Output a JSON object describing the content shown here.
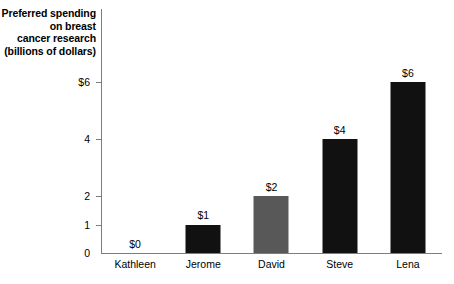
{
  "chart_data": {
    "type": "bar",
    "title": "",
    "ylabel_lines": [
      "Preferred spending",
      "on breast",
      "cancer research",
      "(billions of dollars)"
    ],
    "ylabel": "Preferred spending on breast cancer research (billions of dollars)",
    "xlabel": "",
    "categories": [
      "Kathleen",
      "Jerome",
      "David",
      "Steve",
      "Lena"
    ],
    "values": [
      0,
      1,
      2,
      4,
      6
    ],
    "value_labels": [
      "$0",
      "$1",
      "$2",
      "$4",
      "$6"
    ],
    "bar_colors": [
      "#111111",
      "#111111",
      "#585858",
      "#111111",
      "#111111"
    ],
    "ylim": [
      0,
      6.6
    ],
    "yticks": [
      0,
      1,
      2,
      4,
      6
    ],
    "ytick_labels": [
      "0",
      "1",
      "2",
      "4",
      "$6"
    ],
    "grid": false,
    "legend": "none",
    "axis_color": "#7d7d7d",
    "background": "#ffffff"
  }
}
